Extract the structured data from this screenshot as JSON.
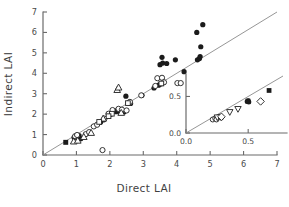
{
  "chart_data": {
    "type": "scatter",
    "title": "",
    "xlabel": "Direct LAI",
    "ylabel": "Indirect LAI",
    "xlim": [
      0,
      7
    ],
    "ylim": [
      0,
      7
    ],
    "xticks": [
      0,
      1,
      2,
      3,
      4,
      5,
      6,
      7
    ],
    "xticklabels": [
      "0",
      "1",
      "2",
      "3",
      "4",
      "5",
      "6",
      "7"
    ],
    "yticks": [
      0,
      1,
      2,
      3,
      4,
      5,
      6,
      7
    ],
    "yticklabels": [
      "0",
      "1",
      "2",
      "3",
      "4",
      "5",
      "6",
      "7"
    ],
    "grid": false,
    "legend": "none",
    "reference_line": {
      "name": "one-to-one-line",
      "slope": 1.0,
      "intercept": 0.0,
      "x_start": 0.0,
      "x_end": 7.0,
      "style": "solid",
      "color": "#8a8a8a"
    },
    "series": [
      {
        "name": "filled circle",
        "marker": "filled-circle",
        "points": [
          [
            0.93,
            0.86
          ],
          [
            1.08,
            0.95
          ],
          [
            1.13,
            0.8
          ],
          [
            1.72,
            1.6
          ],
          [
            1.82,
            1.72
          ],
          [
            2.02,
            1.98
          ],
          [
            2.18,
            2.12
          ],
          [
            2.22,
            2.18
          ],
          [
            2.3,
            2.08
          ],
          [
            2.42,
            2.1
          ],
          [
            2.48,
            2.88
          ],
          [
            2.58,
            2.58
          ],
          [
            2.62,
            2.52
          ],
          [
            2.96,
            2.92
          ],
          [
            3.32,
            3.28
          ],
          [
            3.46,
            3.42
          ],
          [
            3.52,
            3.48
          ],
          [
            3.5,
            4.42
          ],
          [
            3.58,
            4.5
          ],
          [
            3.56,
            4.78
          ],
          [
            3.7,
            4.48
          ],
          [
            3.96,
            4.66
          ],
          [
            4.22,
            4.08
          ],
          [
            4.62,
            4.66
          ],
          [
            4.68,
            4.72
          ],
          [
            4.7,
            4.82
          ],
          [
            4.72,
            5.3
          ],
          [
            4.6,
            6.0
          ],
          [
            4.78,
            6.38
          ]
        ]
      },
      {
        "name": "open circle",
        "marker": "open-circle",
        "points": [
          [
            0.96,
            0.92
          ],
          [
            1.02,
            0.98
          ],
          [
            1.28,
            1.02
          ],
          [
            1.38,
            1.12
          ],
          [
            1.52,
            1.4
          ],
          [
            1.62,
            1.48
          ],
          [
            1.78,
            0.24
          ],
          [
            1.84,
            1.78
          ],
          [
            1.96,
            2.02
          ],
          [
            2.08,
            2.2
          ],
          [
            2.26,
            2.26
          ],
          [
            2.36,
            2.22
          ],
          [
            2.5,
            2.18
          ],
          [
            2.6,
            2.6
          ],
          [
            2.94,
            2.92
          ],
          [
            3.42,
            3.76
          ],
          [
            3.56,
            3.78
          ],
          [
            3.36,
            3.38
          ],
          [
            3.62,
            3.56
          ],
          [
            4.02,
            3.52
          ],
          [
            4.12,
            3.52
          ]
        ]
      },
      {
        "name": "open triangle",
        "marker": "open-triangle",
        "points": [
          [
            0.92,
            0.66
          ],
          [
            1.04,
            0.7
          ],
          [
            1.22,
            0.88
          ],
          [
            1.44,
            1.08
          ],
          [
            2.22,
            3.18
          ],
          [
            2.26,
            3.3
          ],
          [
            2.34,
            2.06
          ],
          [
            1.8,
            1.78
          ]
        ]
      },
      {
        "name": "open square",
        "marker": "open-square",
        "points": [
          [
            1.68,
            1.62
          ],
          [
            2.06,
            2.02
          ],
          [
            2.54,
            2.54
          ],
          [
            3.54,
            3.5
          ],
          [
            1.96,
            1.9
          ]
        ]
      },
      {
        "name": "filled square",
        "marker": "filled-square",
        "points": [
          [
            0.68,
            0.62
          ]
        ]
      }
    ],
    "inset": {
      "name": "inset-detail-plot",
      "xlim": [
        0.0,
        0.78
      ],
      "ylim": [
        0.0,
        0.78
      ],
      "xticks": [
        0.0,
        0.5
      ],
      "xticklabels": [
        "0.0",
        "0.5"
      ],
      "yticks": [
        0.0,
        0.5
      ],
      "yticklabels": [
        "0.0",
        "0.5"
      ],
      "reference_line": {
        "slope": 1.0,
        "intercept": 0.0,
        "x_start": 0.0,
        "x_end": 0.78,
        "color": "#8a8a8a"
      },
      "series": [
        {
          "name": "open circle",
          "marker": "open-circle",
          "points": [
            [
              0.215,
              0.185
            ],
            [
              0.235,
              0.2
            ],
            [
              0.25,
              0.205
            ],
            [
              0.245,
              0.185
            ],
            [
              0.262,
              0.218
            ],
            [
              0.272,
              0.222
            ],
            [
              0.282,
              0.21
            ]
          ]
        },
        {
          "name": "open down triangle",
          "marker": "open-dtriangle",
          "points": [
            [
              0.252,
              0.215
            ],
            [
              0.352,
              0.288
            ],
            [
              0.418,
              0.33
            ]
          ]
        },
        {
          "name": "filled circle",
          "marker": "filled-circle",
          "points": [
            [
              0.492,
              0.432
            ],
            [
              0.5,
              0.44
            ],
            [
              0.505,
              0.425
            ]
          ]
        },
        {
          "name": "open diamond",
          "marker": "open-diamond",
          "points": [
            [
              0.285,
              0.222
            ],
            [
              0.6,
              0.432
            ]
          ]
        },
        {
          "name": "filled square",
          "marker": "filled-square",
          "points": [
            [
              0.668,
              0.582
            ],
            [
              0.498,
              0.438
            ]
          ]
        }
      ]
    }
  }
}
